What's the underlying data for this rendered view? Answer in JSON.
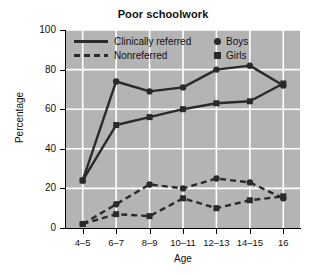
{
  "chart_data": {
    "type": "line",
    "title": "Poor schoolwork",
    "xlabel": "Age",
    "ylabel": "Percentage",
    "categories": [
      "4–5",
      "6–7",
      "8–9",
      "10–11",
      "12–13",
      "14–15",
      "16"
    ],
    "ylim": [
      0,
      100
    ],
    "yticks": [
      0,
      20,
      40,
      60,
      80,
      100
    ],
    "grid": true,
    "legend_position": "upper-left-inside",
    "plot_background": "#b4b4b4",
    "gridline_color": "#ffffff",
    "line_color": "#2a2a2a",
    "series": [
      {
        "name": "Clinically referred Boys",
        "group": "Clinically referred",
        "sex": "Boys",
        "linestyle": "solid",
        "marker": "circle",
        "values": [
          24,
          74,
          69,
          71,
          80,
          82,
          72
        ]
      },
      {
        "name": "Clinically referred Girls",
        "group": "Clinically referred",
        "sex": "Girls",
        "linestyle": "solid",
        "marker": "square",
        "values": [
          24,
          52,
          56,
          60,
          63,
          64,
          73
        ]
      },
      {
        "name": "Nonreferred Boys",
        "group": "Nonreferred",
        "sex": "Boys",
        "linestyle": "dashed",
        "marker": "circle",
        "values": [
          2,
          12,
          22,
          20,
          25,
          23,
          15
        ]
      },
      {
        "name": "Nonreferred Girls",
        "group": "Nonreferred",
        "sex": "Girls",
        "linestyle": "dashed",
        "marker": "square",
        "values": [
          2,
          7,
          6,
          15,
          10,
          14,
          16
        ]
      }
    ]
  },
  "legend": {
    "style_entries": [
      {
        "label": "Clinically referred",
        "linestyle": "solid"
      },
      {
        "label": "Nonreferred",
        "linestyle": "dashed"
      }
    ],
    "marker_entries": [
      {
        "label": "Boys",
        "marker": "circle"
      },
      {
        "label": "Girls",
        "marker": "square"
      }
    ]
  }
}
